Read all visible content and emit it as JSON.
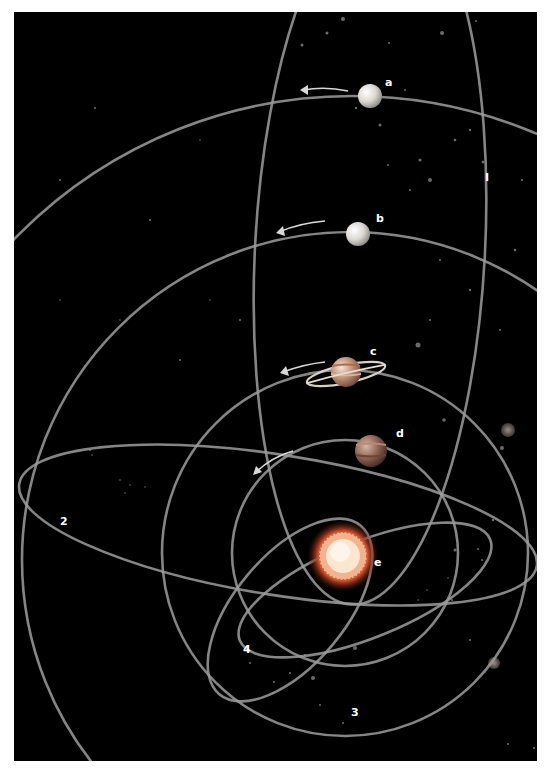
{
  "diagram": {
    "background_color": "#000000",
    "orbit_color": "#9a9a9a",
    "sun": {
      "label": "e",
      "color": "#e8784a",
      "core_color": "#fbe2c8"
    },
    "planets": [
      {
        "id": "a",
        "label": "a",
        "color": "#d9d6d0",
        "type": "plain"
      },
      {
        "id": "b",
        "label": "b",
        "color": "#d9d6d0",
        "type": "plain"
      },
      {
        "id": "c",
        "label": "c",
        "color": "#c89a7a",
        "type": "ringed"
      },
      {
        "id": "d",
        "label": "d",
        "color": "#9a6a55",
        "type": "banded"
      }
    ],
    "orbit_labels": [
      {
        "id": "1",
        "label": "I"
      },
      {
        "id": "2",
        "label": "2"
      },
      {
        "id": "3",
        "label": "3"
      },
      {
        "id": "4",
        "label": "4"
      }
    ]
  }
}
